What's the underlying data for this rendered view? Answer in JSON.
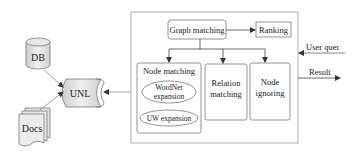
{
  "diagram": {
    "sources": {
      "db": "DB",
      "docs": "Docs",
      "unl": "UNL"
    },
    "system": {
      "graph_matching": "Graph matching",
      "ranking": "Ranking",
      "node_matching": {
        "title": "Node matching",
        "wordnet_line1": "WordNet",
        "wordnet_line2": "expansion",
        "uw_expansion": "UW expansion"
      },
      "relation_matching_line1": "Relation",
      "relation_matching_line2": "matching",
      "node_ignoring_line1": "Node",
      "node_ignoring_line2": "ignoring"
    },
    "io": {
      "user_query": "User quer",
      "result": "Result"
    },
    "colors": {
      "stroke": "#7a7a7a",
      "shape_fill": "#e6e6e6",
      "text": "#222222"
    }
  }
}
